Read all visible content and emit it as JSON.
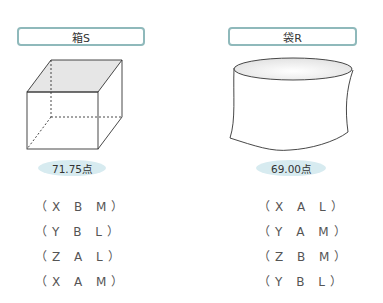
{
  "items": [
    {
      "label": "箱S",
      "score": "71.75点",
      "options": [
        "（X B M）",
        "（Y B L）",
        "（Z A L）",
        "（X A M）"
      ]
    },
    {
      "label": "袋R",
      "score": "69.00点",
      "options": [
        "（X A L）",
        "（Y A M）",
        "（Z B M）",
        "（Y B L）"
      ]
    }
  ],
  "colors": {
    "label_border": "#8fb9bb",
    "badge_fill": "#d7ebf0",
    "cube_top_fill": "#e6e6e6"
  }
}
